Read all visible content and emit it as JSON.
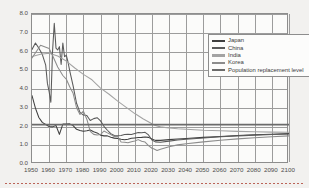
{
  "chart_data": {
    "type": "line",
    "title": "",
    "xlabel": "",
    "ylabel": "",
    "xlim": [
      1950,
      2100
    ],
    "ylim": [
      0.0,
      8.0
    ],
    "grid": true,
    "legend_position": "top-right",
    "x_ticks": [
      1950,
      1960,
      1970,
      1980,
      1990,
      2000,
      2010,
      2020,
      2030,
      2040,
      2050,
      2060,
      2070,
      2080,
      2090,
      2100
    ],
    "y_ticks": [
      "0.0",
      "1.0",
      "2.0",
      "3.0",
      "4.0",
      "5.0",
      "6.0",
      "7.0",
      "8.0"
    ],
    "series": [
      {
        "name": "Japan",
        "color": "#3e3e3e",
        "x": [
          1950,
          1952,
          1954,
          1956,
          1958,
          1960,
          1962,
          1964,
          1966,
          1968,
          1970,
          1972,
          1974,
          1976,
          1978,
          1980,
          1982,
          1984,
          1986,
          1988,
          1990,
          1992,
          1994,
          1996,
          1998,
          2000,
          2002,
          2004,
          2006,
          2008,
          2010,
          2012,
          2014,
          2016,
          2018,
          2020,
          2022,
          2025,
          2030,
          2035,
          2040,
          2050,
          2060,
          2070,
          2080,
          2090,
          2100
        ],
        "y": [
          3.65,
          2.98,
          2.48,
          2.22,
          2.11,
          2.0,
          1.98,
          2.05,
          1.58,
          2.13,
          2.13,
          2.14,
          2.05,
          1.85,
          1.79,
          1.75,
          1.77,
          1.81,
          1.72,
          1.66,
          1.54,
          1.5,
          1.5,
          1.43,
          1.38,
          1.36,
          1.32,
          1.29,
          1.32,
          1.37,
          1.39,
          1.41,
          1.42,
          1.44,
          1.42,
          1.33,
          1.26,
          1.26,
          1.3,
          1.33,
          1.36,
          1.42,
          1.47,
          1.52,
          1.56,
          1.59,
          1.62
        ]
      },
      {
        "name": "China",
        "color": "#5a5a5a",
        "x": [
          1950,
          1952,
          1954,
          1956,
          1958,
          1959,
          1960,
          1961,
          1962,
          1963,
          1964,
          1965,
          1966,
          1967,
          1968,
          1969,
          1970,
          1971,
          1972,
          1974,
          1976,
          1978,
          1980,
          1982,
          1984,
          1986,
          1988,
          1990,
          1992,
          1994,
          1996,
          1998,
          2000,
          2002,
          2004,
          2006,
          2008,
          2010,
          2012,
          2014,
          2016,
          2018,
          2020,
          2022,
          2025,
          2030,
          2035,
          2040,
          2050,
          2060,
          2070,
          2080,
          2090,
          2100
        ],
        "y": [
          6.11,
          6.45,
          6.18,
          5.85,
          5.27,
          4.3,
          3.86,
          3.29,
          6.02,
          7.51,
          6.18,
          6.08,
          6.26,
          5.31,
          6.45,
          5.72,
          5.81,
          5.44,
          4.98,
          4.17,
          3.24,
          2.75,
          2.61,
          2.59,
          2.32,
          2.42,
          2.47,
          2.3,
          2.01,
          1.8,
          1.62,
          1.52,
          1.51,
          1.52,
          1.57,
          1.59,
          1.57,
          1.63,
          1.68,
          1.67,
          1.69,
          1.55,
          1.28,
          1.18,
          1.16,
          1.22,
          1.28,
          1.32,
          1.39,
          1.45,
          1.5,
          1.54,
          1.57,
          1.6
        ]
      },
      {
        "name": "India",
        "color": "#a3a3a3",
        "x": [
          1950,
          1955,
          1960,
          1965,
          1970,
          1975,
          1980,
          1985,
          1990,
          1995,
          2000,
          2005,
          2010,
          2015,
          2020,
          2022,
          2025,
          2030,
          2035,
          2040,
          2050,
          2060,
          2070,
          2080,
          2090,
          2100
        ],
        "y": [
          5.73,
          5.85,
          5.91,
          5.76,
          5.49,
          5.12,
          4.78,
          4.49,
          4.05,
          3.72,
          3.35,
          3.02,
          2.69,
          2.4,
          2.15,
          2.05,
          1.98,
          1.92,
          1.88,
          1.85,
          1.8,
          1.77,
          1.74,
          1.72,
          1.7,
          1.69
        ]
      },
      {
        "name": "Korea",
        "color": "#8c8c8c",
        "x": [
          1950,
          1955,
          1960,
          1962,
          1965,
          1968,
          1970,
          1972,
          1974,
          1976,
          1978,
          1980,
          1982,
          1984,
          1986,
          1988,
          1990,
          1992,
          1994,
          1996,
          1998,
          2000,
          2002,
          2004,
          2006,
          2008,
          2010,
          2012,
          2014,
          2016,
          2018,
          2020,
          2021,
          2023,
          2025,
          2030,
          2035,
          2040,
          2050,
          2060,
          2070,
          2080,
          2090,
          2100
        ],
        "y": [
          5.65,
          6.33,
          6.16,
          5.79,
          5.17,
          4.72,
          4.53,
          4.12,
          3.77,
          3.0,
          2.64,
          2.82,
          2.39,
          1.74,
          1.58,
          1.55,
          1.57,
          1.76,
          1.66,
          1.57,
          1.46,
          1.47,
          1.17,
          1.16,
          1.13,
          1.19,
          1.23,
          1.3,
          1.21,
          1.17,
          0.98,
          0.84,
          0.81,
          0.72,
          0.79,
          0.92,
          1.02,
          1.08,
          1.18,
          1.27,
          1.34,
          1.4,
          1.45,
          1.5
        ]
      },
      {
        "name": "Population replacement level",
        "color": "#6b6b6b",
        "x": [
          1950,
          2100
        ],
        "y": [
          2.1,
          2.1
        ]
      }
    ]
  },
  "legend": {
    "items": [
      {
        "label": "Japan",
        "color": "#3e3e3e"
      },
      {
        "label": "China",
        "color": "#5a5a5a"
      },
      {
        "label": "India",
        "color": "#a3a3a3"
      },
      {
        "label": "Korea",
        "color": "#8c8c8c"
      },
      {
        "label": "Population replacement level",
        "color": "#6b6b6b"
      }
    ]
  }
}
